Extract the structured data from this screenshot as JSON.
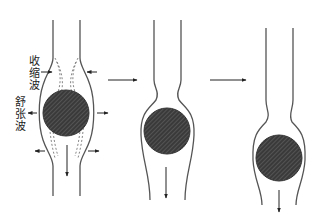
{
  "diagram": {
    "title": "",
    "labels": {
      "contraction_wave": [
        "收",
        "缩",
        "波"
      ],
      "relaxation_wave": [
        "舒",
        "张",
        "波"
      ]
    },
    "stages": [
      {
        "name": "stage-1",
        "description": "Bolus in tube with contraction wave above and relaxation wave around"
      },
      {
        "name": "stage-2",
        "description": "Bolus moved down, constriction above"
      },
      {
        "name": "stage-3",
        "description": "Bolus moved further down"
      }
    ],
    "colors": {
      "line": "#555555",
      "bolus_fill": "#3a3a3a",
      "hatch": "#7a7a7a",
      "background": "#ffffff"
    }
  }
}
